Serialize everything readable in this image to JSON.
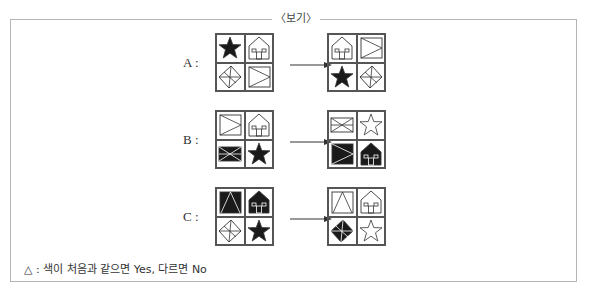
{
  "box": {
    "title": "〈보기〉",
    "note": "△ : 색이 처음과 같으면 Yes, 다르면 No"
  },
  "rows": [
    {
      "label": "A :",
      "before": [
        {
          "shape": "star",
          "filled": true
        },
        {
          "shape": "house",
          "filled": false
        },
        {
          "shape": "diamond-cross",
          "filled": false
        },
        {
          "shape": "square-triangle",
          "filled": false
        }
      ],
      "after": [
        {
          "shape": "house",
          "filled": false
        },
        {
          "shape": "square-triangle",
          "filled": false
        },
        {
          "shape": "star",
          "filled": true
        },
        {
          "shape": "diamond-cross",
          "filled": false
        }
      ]
    },
    {
      "label": "B :",
      "before": [
        {
          "shape": "square-triangle",
          "filled": false
        },
        {
          "shape": "house",
          "filled": false
        },
        {
          "shape": "envelope",
          "filled": true
        },
        {
          "shape": "star",
          "filled": true
        }
      ],
      "after": [
        {
          "shape": "envelope",
          "filled": false
        },
        {
          "shape": "star",
          "filled": false
        },
        {
          "shape": "square-triangle",
          "filled": true
        },
        {
          "shape": "house",
          "filled": true
        }
      ]
    },
    {
      "label": "C :",
      "before": [
        {
          "shape": "square-apex",
          "filled": true
        },
        {
          "shape": "house",
          "filled": true
        },
        {
          "shape": "diamond-cross",
          "filled": false
        },
        {
          "shape": "star",
          "filled": true
        }
      ],
      "after": [
        {
          "shape": "square-apex",
          "filled": false
        },
        {
          "shape": "house",
          "filled": false
        },
        {
          "shape": "diamond-cross",
          "filled": true
        },
        {
          "shape": "star",
          "filled": false
        }
      ]
    }
  ],
  "colors": {
    "fill": "#1a1a1a",
    "stroke": "#333333",
    "frame": "#b5b5b5"
  }
}
